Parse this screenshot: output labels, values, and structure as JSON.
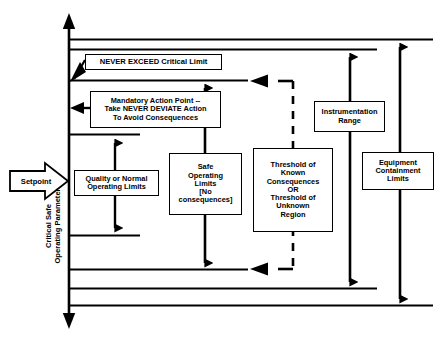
{
  "diagram": {
    "axis": {
      "label": "Critical Safe\nOperating Parameter",
      "name": "critical-safe-operating-parameter-axis"
    },
    "setpoint": {
      "label": "Setpoint"
    },
    "boxes": {
      "never_exceed": "NEVER EXCEED Critical Limit",
      "mandatory_action": "Mandatory Action Point --\nTake NEVER DEVIATE Action\nTo Avoid Consequences",
      "quality_normal": "Quality or Normal\nOperating Limits",
      "safe_operating": "Safe\nOperating\nLimits\n[No\nconsequences]",
      "threshold": "Threshold of\nKnown\nConsequences\nOR\nThreshold of\nUnknown\nRegion",
      "instrumentation": "Instrumentation\nRange",
      "equipment": "Equipment\nContainment\nLimits"
    },
    "colors": {
      "stroke": "#000000",
      "background": "#ffffff"
    }
  }
}
